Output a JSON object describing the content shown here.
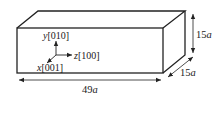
{
  "diagram": {
    "type": "rectangular-prism-dimensions",
    "dimensions": {
      "length": {
        "value": "49",
        "unit": "a"
      },
      "height": {
        "value": "15",
        "unit": "a"
      },
      "depth": {
        "value": "15",
        "unit": "a"
      }
    },
    "axes": {
      "y": {
        "letter": "y",
        "index": "[010]"
      },
      "z": {
        "letter": "z",
        "index": "[100]"
      },
      "x": {
        "letter": "x",
        "index": "[001]"
      }
    },
    "colors": {
      "line": "#222222",
      "background": "#ffffff"
    }
  }
}
